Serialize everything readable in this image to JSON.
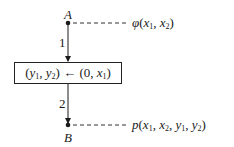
{
  "diagram": {
    "type": "flowchart",
    "nodes": [
      {
        "id": "A",
        "label": "A",
        "annotation": {
          "func": "φ",
          "args": [
            [
              "x",
              "1"
            ],
            [
              "x",
              "2"
            ]
          ]
        }
      },
      {
        "id": "B",
        "label": "B",
        "annotation": {
          "func": "p",
          "args": [
            [
              "x",
              "1"
            ],
            [
              "x",
              "2"
            ],
            [
              "y",
              "1"
            ],
            [
              "y",
              "2"
            ]
          ]
        }
      }
    ],
    "box": {
      "lhs": [
        [
          "y",
          "1"
        ],
        [
          "y",
          "2"
        ]
      ],
      "arrow": "←",
      "rhs": [
        [
          "0",
          ""
        ],
        [
          "x",
          "1"
        ]
      ]
    },
    "edges": [
      {
        "label": "1",
        "from": "A",
        "to": "box"
      },
      {
        "label": "2",
        "from": "box",
        "to": "B"
      }
    ]
  },
  "labels": {
    "node_a": "A",
    "node_b": "B",
    "edge_1": "1",
    "edge_2": "2",
    "assign_arrow": "←",
    "phi": "φ",
    "p": "p"
  },
  "colors": {
    "ink": "#1a1a1a",
    "background": "#ffffff"
  }
}
